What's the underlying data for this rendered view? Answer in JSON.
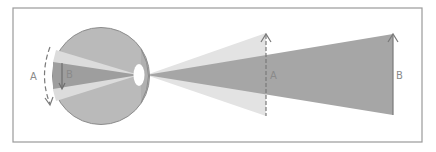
{
  "diagram": {
    "type": "eye-visual-angle",
    "colors": {
      "frame": "#9a9a9a",
      "background": "#ffffff",
      "eyeball": "#b9b9b9",
      "eyeball_edge": "#8c8c8c",
      "light_wedge": "#e3e3e3",
      "dark_beam": "#a3a3a3",
      "lens": "#ffffff",
      "arrow": "#7a7a7a",
      "label": "#8a8a8a"
    },
    "labels": {
      "retina_image_a": "A",
      "retina_image_b": "B",
      "object_a": "A",
      "object_b": "B"
    },
    "objects": [
      {
        "name": "A",
        "x": 266,
        "y_top": 33,
        "y_bottom": 115,
        "style": "dashed"
      },
      {
        "name": "B",
        "x": 393,
        "y_top": 33,
        "y_bottom": 115,
        "style": "solid"
      }
    ],
    "retina_images": [
      {
        "name": "A",
        "style": "dashed-curved",
        "direction": "down"
      },
      {
        "name": "B",
        "style": "solid",
        "direction": "down"
      }
    ]
  }
}
